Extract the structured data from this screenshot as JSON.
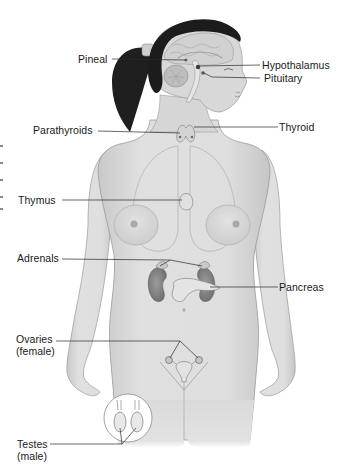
{
  "diagram": {
    "colors": {
      "skin_fill": "#dcdcdc",
      "skin_shade": "#c4c4c4",
      "outline": "#9a9a9a",
      "hair": "#1c1c1c",
      "brain": "#cfcfcf",
      "organ": "#8f8f8f",
      "kidney": "#7e7e7e",
      "leader_line": "#2a2a2a",
      "label_text": "#1a1a1a",
      "background": "#ffffff"
    },
    "labels": [
      {
        "id": "pineal",
        "text": "Pineal",
        "side": "left"
      },
      {
        "id": "hypothalamus",
        "text": "Hypothalamus",
        "side": "right"
      },
      {
        "id": "pituitary",
        "text": "Pituitary",
        "side": "right"
      },
      {
        "id": "parathyroids",
        "text": "Parathyroids",
        "side": "left"
      },
      {
        "id": "thyroid",
        "text": "Thyroid",
        "side": "right"
      },
      {
        "id": "thymus",
        "text": "Thymus",
        "side": "left"
      },
      {
        "id": "adrenals",
        "text": "Adrenals",
        "side": "left"
      },
      {
        "id": "pancreas",
        "text": "Pancreas",
        "side": "right"
      },
      {
        "id": "ovaries",
        "text": "Ovaries\n(female)",
        "side": "left"
      },
      {
        "id": "testes",
        "text": "Testes\n(male)",
        "side": "left"
      }
    ]
  }
}
